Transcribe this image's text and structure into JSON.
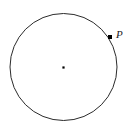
{
  "figure": {
    "type": "geometry-diagram",
    "canvas": {
      "width": 130,
      "height": 133,
      "background_color": "#ffffff"
    },
    "colors": {
      "stroke": "#2b2b2b",
      "point_fill": "#000000",
      "label_text": "#1d1d1d",
      "background": "#ffffff"
    },
    "circle": {
      "center_x": 63.5,
      "center_y": 67,
      "radius": 53.5,
      "stroke_width": 1,
      "fill": "none"
    },
    "center_point": {
      "label": "",
      "x": 63.5,
      "y": 67.5,
      "size": 2.2
    },
    "labeled_points": [
      {
        "label": "P",
        "x": 110,
        "y": 37,
        "size": 4,
        "label_offset_x": 6,
        "label_offset_y": -8,
        "on_circumference": true,
        "angle_degrees": 32
      }
    ]
  }
}
